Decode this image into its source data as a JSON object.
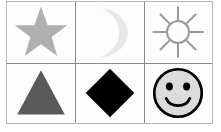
{
  "figure": {
    "rows": 2,
    "columns": 3,
    "background_color": "#ffffff",
    "frame_color": "#b9b9b9",
    "grid_line_color": "#8a8a8a",
    "cell_background": "#fdfdfd"
  },
  "cells": [
    {
      "position": "row-1-col-1",
      "icon": "star-icon",
      "label": "Star",
      "style": "filled",
      "fill_color": "#b0b0b0",
      "stroke_color": "none",
      "points": 5
    },
    {
      "position": "row-1-col-2",
      "icon": "crescent-moon-icon",
      "label": "Crescent Moon",
      "style": "filled",
      "fill_color": "#e8e8e8",
      "stroke_color": "none",
      "opening": "left"
    },
    {
      "position": "row-1-col-3",
      "icon": "sun-icon",
      "label": "Sun",
      "style": "outline",
      "fill_color": "none",
      "stroke_color": "#9a9a9a",
      "rays": 8
    },
    {
      "position": "row-2-col-1",
      "icon": "triangle-icon",
      "label": "Triangle",
      "style": "filled",
      "fill_color": "#5a5a5a",
      "stroke_color": "none",
      "sides": 3
    },
    {
      "position": "row-2-col-2",
      "icon": "diamond-icon",
      "label": "Diamond",
      "style": "filled",
      "fill_color": "#000000",
      "stroke_color": "none",
      "sides": 4
    },
    {
      "position": "row-2-col-3",
      "icon": "smiley-face-icon",
      "label": "Smiley Face",
      "style": "outline-filled",
      "fill_color": "#dcdcdc",
      "stroke_color": "#000000",
      "eyes": 2,
      "mouth": "smile"
    }
  ]
}
